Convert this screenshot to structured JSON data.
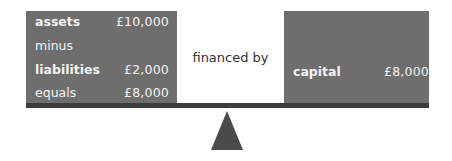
{
  "left_panel": {
    "rows": [
      {
        "label": "assets",
        "value": "£10,000",
        "bold": true
      },
      {
        "label": "minus",
        "value": "",
        "bold": false
      },
      {
        "label": "liabilities",
        "value": "£2,000",
        "bold": true
      },
      {
        "label": "equals",
        "value": "£8,000",
        "bold": false
      }
    ]
  },
  "middle": {
    "text": "financed by"
  },
  "right_panel": {
    "label": "capital",
    "value": "£8,000"
  },
  "colors": {
    "panel": "#6e6e6e",
    "beam": "#3c3c3c",
    "fulcrum": "#4a4a4a",
    "panel_text": "#f2f2f2"
  }
}
